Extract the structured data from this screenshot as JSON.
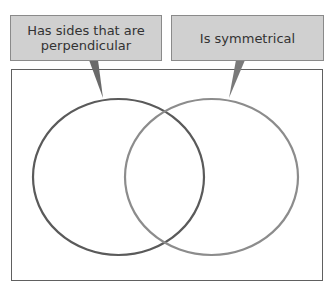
{
  "diagram": {
    "type": "venn",
    "sets": [
      {
        "label_line1": "Has sides that are",
        "label_line2": "perpendicular",
        "color": "#5a5a5a"
      },
      {
        "label": "Is symmetrical",
        "color": "#8c8c8c"
      }
    ],
    "colors": {
      "label_fill": "#d0d0d0",
      "label_border": "#8a8a8a",
      "frame": "#606060"
    }
  }
}
